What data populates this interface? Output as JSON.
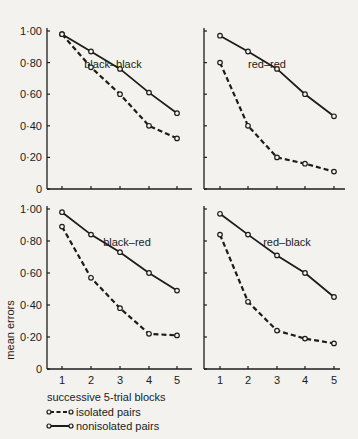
{
  "chart_data": {
    "type": "line",
    "ylabel": "mean errors",
    "xlabel": "successive 5-trial blocks",
    "x": [
      1,
      2,
      3,
      4,
      5
    ],
    "ylim": [
      0,
      1.0
    ],
    "yticks": [
      "0",
      "0·20",
      "0·40",
      "0·60",
      "0·80",
      "1·00"
    ],
    "xticks": [
      "1",
      "2",
      "3",
      "4",
      "5"
    ],
    "grid": false,
    "legend": {
      "position": "bottom-left",
      "entries": [
        {
          "name": "isolated pairs",
          "style": "dashed",
          "marker": "open-circle"
        },
        {
          "name": "nonisolated pairs",
          "style": "solid",
          "marker": "open-circle"
        }
      ]
    },
    "panels": [
      {
        "title": "black–black",
        "position": "top-left",
        "series": [
          {
            "name": "isolated pairs",
            "values": [
              0.98,
              0.77,
              0.6,
              0.4,
              0.32
            ]
          },
          {
            "name": "nonisolated pairs",
            "values": [
              0.98,
              0.87,
              0.76,
              0.61,
              0.48
            ]
          }
        ]
      },
      {
        "title": "red–red",
        "position": "top-right",
        "series": [
          {
            "name": "isolated pairs",
            "values": [
              0.8,
              0.4,
              0.2,
              0.16,
              0.11
            ]
          },
          {
            "name": "nonisolated pairs",
            "values": [
              0.97,
              0.87,
              0.76,
              0.6,
              0.46
            ]
          }
        ]
      },
      {
        "title": "black–red",
        "position": "bottom-left",
        "series": [
          {
            "name": "isolated pairs",
            "values": [
              0.89,
              0.57,
              0.38,
              0.22,
              0.21
            ]
          },
          {
            "name": "nonisolated pairs",
            "values": [
              0.98,
              0.84,
              0.73,
              0.6,
              0.49
            ]
          }
        ]
      },
      {
        "title": "red–black",
        "position": "bottom-right",
        "series": [
          {
            "name": "isolated pairs",
            "values": [
              0.84,
              0.42,
              0.24,
              0.19,
              0.16
            ]
          },
          {
            "name": "nonisolated pairs",
            "values": [
              0.97,
              0.84,
              0.71,
              0.6,
              0.45
            ]
          }
        ]
      }
    ]
  },
  "labels": {
    "ylabel": "mean errors",
    "xlabel": "successive 5-trial blocks",
    "legend_isolated": "isolated pairs",
    "legend_nonisolated": "nonisolated pairs"
  },
  "colors": {
    "ink": "#1c1c1c",
    "background": "#f3f2ee"
  }
}
